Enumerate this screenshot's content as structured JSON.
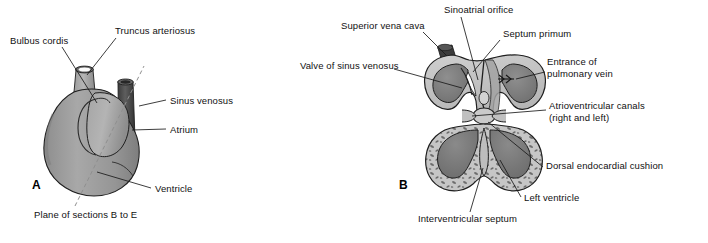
{
  "figure": {
    "type": "anatomical-diagram",
    "background_color": "#ffffff",
    "line_color": "#1a1a1a"
  },
  "palette": {
    "body_light": "#b9b9b9",
    "body_mid": "#9a9a9a",
    "body_dark": "#7c7c7c",
    "tube_dark": "#4a4a4a",
    "tube_darker": "#3a3a3a",
    "wall_light": "#c9c9c9",
    "lumen_dark": "#848484",
    "lumen_darker": "#6f6f6f",
    "highlight": "#ffffff",
    "outline": "#262626",
    "dashed_line": "#8a8a8a"
  },
  "panels": [
    {
      "id": "A",
      "letter": "A",
      "letter_pos": {
        "x": 32,
        "y": 183
      },
      "view": "external view of primitive heart tube",
      "labels": [
        {
          "name": "bulbus-cordis",
          "text": "Bulbus cordis",
          "x": 10,
          "y": 41,
          "align": "left",
          "leader": [
            [
              62,
              50
            ],
            [
              97,
              103
            ]
          ]
        },
        {
          "name": "truncus-arteriosus",
          "text": "Truncus arteriosus",
          "x": 115,
          "y": 31,
          "align": "left",
          "leader": [
            [
              115,
              40
            ],
            [
              87,
              75
            ]
          ]
        },
        {
          "name": "sinus-venosus",
          "text": "Sinus venosus",
          "x": 170,
          "y": 98,
          "align": "left",
          "leader": [
            [
              167,
              101
            ],
            [
              139,
              105
            ]
          ]
        },
        {
          "name": "atrium",
          "text": "Atrium",
          "x": 170,
          "y": 127,
          "align": "left",
          "leader": [
            [
              167,
              130
            ],
            [
              133,
              130
            ]
          ]
        },
        {
          "name": "ventricle",
          "text": "Ventricle",
          "x": 155,
          "y": 187,
          "align": "left",
          "leader": [
            [
              152,
              190
            ],
            [
              98,
              172
            ]
          ]
        },
        {
          "name": "plane-of-sections",
          "text": "Plane of sections B to E",
          "x": 34,
          "y": 213,
          "align": "left",
          "leader": []
        }
      ],
      "plane_line": {
        "name": "plane-of-sections-dashed-line",
        "from": [
          75,
          206
        ],
        "to": [
          144,
          66
        ]
      }
    },
    {
      "id": "B",
      "letter": "B",
      "letter_pos": {
        "x": 399,
        "y": 183
      },
      "view": "frontal section of heart showing atrial and ventricular chambers",
      "labels": [
        {
          "name": "sinoatrial-orifice",
          "text": "Sinoatrial orifice",
          "x": 444,
          "y": 8,
          "align": "left",
          "leader": [
            [
              460,
              18
            ],
            [
              478,
              80
            ]
          ]
        },
        {
          "name": "superior-vena-cava",
          "text": "Superior vena cava",
          "x": 341,
          "y": 24,
          "align": "left",
          "leader": [
            [
              424,
              33
            ],
            [
              447,
              56
            ]
          ]
        },
        {
          "name": "septum-primum",
          "text": "Septum primum",
          "x": 503,
          "y": 32,
          "align": "left",
          "leader": [
            [
              501,
              41
            ],
            [
              472,
              72
            ]
          ]
        },
        {
          "name": "valve-of-sinus-venosus",
          "text": "Valve of sinus venosus",
          "x": 300,
          "y": 64,
          "align": "left",
          "leader": [
            [
              395,
              70
            ],
            [
              462,
              88
            ]
          ]
        },
        {
          "name": "entrance-of-pulmonary-vein",
          "text": "Entrance of\npulmonary vein",
          "x": 547,
          "y": 62,
          "align": "left",
          "leader": [
            [
              545,
              72
            ],
            [
              502,
              79
            ]
          ]
        },
        {
          "name": "atrioventricular-canals",
          "text": "Atrioventricular canals\n(right and left)",
          "x": 549,
          "y": 104,
          "align": "left",
          "leader": [
            [
              546,
              110
            ],
            [
              470,
              115
            ]
          ]
        },
        {
          "name": "dorsal-endocardial-cushion",
          "text": "Dorsal endocardial cushion",
          "x": 546,
          "y": 164,
          "align": "left",
          "leader": [
            [
              543,
              168
            ],
            [
              481,
              121
            ]
          ]
        },
        {
          "name": "left-ventricle",
          "text": "Left ventricle",
          "x": 524,
          "y": 196,
          "align": "left",
          "leader": [
            [
              521,
              198
            ],
            [
              498,
              160
            ]
          ]
        },
        {
          "name": "interventricular-septum",
          "text": "Interventricular septum",
          "x": 418,
          "y": 217,
          "align": "left",
          "leader": [
            [
              470,
              213
            ],
            [
              483,
              166
            ]
          ]
        }
      ]
    }
  ],
  "annotations": {
    "pulmonary_vein_arrow": {
      "name": "pulmonary-vein-flow-arrow",
      "symbol": "double-chevron-arrow",
      "x": 492,
      "y": 78
    }
  }
}
